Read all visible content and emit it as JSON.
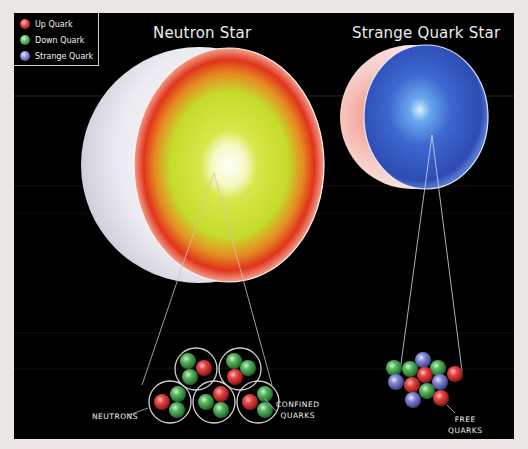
{
  "legend": {
    "items": [
      {
        "label": "Up Quark",
        "color": "#e03a3a"
      },
      {
        "label": "Down Quark",
        "color": "#4fb35a"
      },
      {
        "label": "Strange Quark",
        "color": "#7a7ed0"
      }
    ]
  },
  "titles": {
    "neutron_star": "Neutron Star",
    "strange_star": "Strange Quark Star"
  },
  "captions": {
    "neutrons": "NEUTRONS",
    "confined_line1": "CONFINED",
    "confined_line2": "QUARKS",
    "free_line1": "FREE",
    "free_line2": "QUARKS"
  },
  "colors": {
    "background_frame": "#ece6e4",
    "panel": "#000000",
    "neutron_crust": "#e23a1c",
    "neutron_core": "#c8e030",
    "neutron_center": "#ffffff",
    "strange_body": "#3a5cc8",
    "strange_center": "#a8d8ff",
    "shell": "#f0eef4"
  }
}
